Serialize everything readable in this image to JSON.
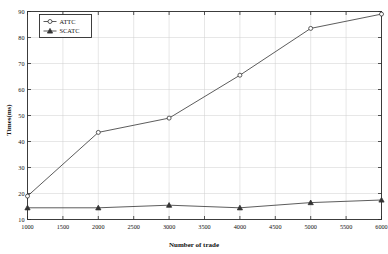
{
  "chart_data": {
    "type": "line",
    "title": "",
    "xlabel": "Number of trade",
    "ylabel": "Times(ms)",
    "xlim": [
      1000,
      6000
    ],
    "ylim": [
      10,
      90
    ],
    "grid": true,
    "legend_position": "top-left",
    "x": [
      1000,
      2000,
      3000,
      4000,
      5000,
      6000
    ],
    "xticks": [
      "1000",
      "1500",
      "2000",
      "2500",
      "3000",
      "3500",
      "4000",
      "4500",
      "5000",
      "5500",
      "6000"
    ],
    "xtick_values": [
      1000,
      1500,
      2000,
      2500,
      3000,
      3500,
      4000,
      4500,
      5000,
      5500,
      6000
    ],
    "yticks": [
      "10",
      "20",
      "30",
      "40",
      "50",
      "60",
      "70",
      "80",
      "90"
    ],
    "ytick_values": [
      10,
      20,
      30,
      40,
      50,
      60,
      70,
      80,
      90
    ],
    "series": [
      {
        "name": "ATTC",
        "marker": "circle-open",
        "color": "#4a4a4a",
        "values": [
          19,
          43.5,
          49,
          65.5,
          83.5,
          89
        ]
      },
      {
        "name": "SCATC",
        "marker": "triangle-filled",
        "color": "#333333",
        "values": [
          14.5,
          14.5,
          15.5,
          14.5,
          16.5,
          17.5
        ]
      }
    ]
  },
  "legend": {
    "entries": [
      {
        "label": "ATTC"
      },
      {
        "label": "SCATC"
      }
    ]
  },
  "axes": {
    "x_title": "Number of trade",
    "y_title": "Times(ms)"
  }
}
